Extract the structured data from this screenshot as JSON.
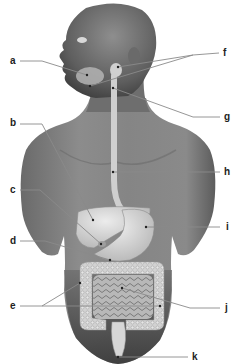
{
  "diagram": {
    "type": "anatomical-labeling-diagram",
    "colors": {
      "background": "#ffffff",
      "skin_dark": "#5a5a5a",
      "skin_mid": "#7c7c7c",
      "skin_light": "#9a9a9a",
      "organ": "#c8c8c8",
      "organ_light": "#dedede",
      "leader_line": "#8a8a8a",
      "label_text": "#222222"
    },
    "labels": [
      {
        "id": "a",
        "text": "a",
        "side": "left",
        "pointer": "salivary glands (cheek / jaw)"
      },
      {
        "id": "b",
        "text": "b",
        "side": "left",
        "pointer": "liver"
      },
      {
        "id": "c",
        "text": "c",
        "side": "left",
        "pointer": "gallbladder"
      },
      {
        "id": "d",
        "text": "d",
        "side": "left",
        "pointer": "pancreas"
      },
      {
        "id": "e",
        "text": "e",
        "side": "left",
        "pointer": "large intestine (two leader lines)"
      },
      {
        "id": "f",
        "text": "f",
        "side": "right",
        "pointer": "pharynx / salivary gland (two leader lines)"
      },
      {
        "id": "g",
        "text": "g",
        "side": "right",
        "pointer": "upper esophagus / larynx region"
      },
      {
        "id": "h",
        "text": "h",
        "side": "right",
        "pointer": "esophagus"
      },
      {
        "id": "i",
        "text": "i",
        "side": "right",
        "pointer": "stomach"
      },
      {
        "id": "j",
        "text": "j",
        "side": "right",
        "pointer": "small intestine"
      },
      {
        "id": "k",
        "text": "k",
        "side": "right",
        "pointer": "rectum / anus"
      }
    ]
  }
}
